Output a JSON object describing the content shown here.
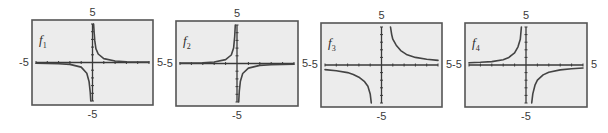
{
  "figure": {
    "background": "#ffffff",
    "frame_fill": "#ececec",
    "frame_stroke": "#555555",
    "axis_color": "#3a3a3a",
    "curve_color": "#444444"
  },
  "chart_data": [
    {
      "type": "line",
      "title": "f1",
      "name_base": "f",
      "name_sub": "1",
      "xlim": [
        -5,
        5
      ],
      "ylim": [
        -5,
        5
      ],
      "tick_labels": {
        "left": "-5",
        "right": "5",
        "top": "5",
        "bottom": "-5"
      },
      "ticks_each_axis": 10,
      "grid": false,
      "vertical_asymptote": 0,
      "horizontal_asymptote": 0,
      "description": "Hyperbola-like, branches in quadrants I and III, hugging axes closely",
      "series": [
        {
          "name": "left_branch",
          "x": [
            -5,
            -3,
            -2,
            -1,
            -0.5,
            -0.3,
            -0.2,
            -0.15
          ],
          "y": [
            -0.1,
            -0.15,
            -0.25,
            -0.6,
            -1.4,
            -2.5,
            -3.8,
            -5
          ]
        },
        {
          "name": "right_branch",
          "x": [
            0.1,
            0.15,
            0.2,
            0.3,
            0.5,
            1,
            2,
            3,
            5
          ],
          "y": [
            5,
            3.8,
            2.8,
            1.8,
            1.1,
            0.5,
            0.2,
            0.1,
            0.05
          ]
        }
      ],
      "frame": {
        "x": 32,
        "y": 20,
        "w": 121,
        "h": 85
      }
    },
    {
      "type": "line",
      "title": "f2",
      "name_base": "f",
      "name_sub": "2",
      "xlim": [
        -5,
        5
      ],
      "ylim": [
        -5,
        5
      ],
      "tick_labels": {
        "left": "-5",
        "right": "5",
        "top": "5",
        "bottom": "-5"
      },
      "ticks_each_axis": 10,
      "grid": false,
      "vertical_asymptote": 0,
      "horizontal_asymptote": 0,
      "description": "Hyperbola-like, branches in quadrants II and IV, hugging axes closely",
      "series": [
        {
          "name": "left_branch",
          "x": [
            -5,
            -3,
            -2,
            -1,
            -0.5,
            -0.3,
            -0.2,
            -0.15
          ],
          "y": [
            0.05,
            0.1,
            0.2,
            0.5,
            1.1,
            2.0,
            3.5,
            5
          ]
        },
        {
          "name": "right_branch",
          "x": [
            0.15,
            0.2,
            0.3,
            0.5,
            1,
            2,
            3,
            5
          ],
          "y": [
            -5,
            -3.6,
            -2.3,
            -1.3,
            -0.6,
            -0.25,
            -0.15,
            -0.08
          ]
        }
      ],
      "frame": {
        "x": 176,
        "y": 21,
        "w": 122,
        "h": 85
      }
    },
    {
      "type": "line",
      "title": "f3",
      "name_base": "f",
      "name_sub": "3",
      "xlim": [
        -5,
        5
      ],
      "ylim": [
        -5,
        5
      ],
      "tick_labels": {
        "left": "-5",
        "right": "5",
        "top": "5",
        "bottom": "-5"
      },
      "ticks_each_axis": 10,
      "grid": false,
      "vertical_asymptote": 0,
      "horizontal_asymptote": 0,
      "description": "Hyperbola with wider spread, branches in quadrants I and III",
      "series": [
        {
          "name": "left_branch",
          "x": [
            -5,
            -4,
            -3,
            -2.5,
            -2,
            -1.5,
            -1.2,
            -1.0,
            -0.9
          ],
          "y": [
            -0.6,
            -0.75,
            -1.0,
            -1.25,
            -1.6,
            -2.2,
            -2.8,
            -3.8,
            -5
          ]
        },
        {
          "name": "right_branch",
          "x": [
            0.8,
            0.9,
            1.0,
            1.3,
            1.7,
            2.2,
            3,
            4,
            5
          ],
          "y": [
            5,
            4.0,
            3.4,
            2.6,
            1.9,
            1.4,
            1.0,
            0.75,
            0.6
          ]
        }
      ],
      "frame": {
        "x": 321,
        "y": 23,
        "w": 121,
        "h": 84
      }
    },
    {
      "type": "line",
      "title": "f4",
      "name_base": "f",
      "name_sub": "4",
      "xlim": [
        -5,
        5
      ],
      "ylim": [
        -5,
        5
      ],
      "tick_labels": {
        "left": "-5",
        "right": "5",
        "top": "5",
        "bottom": "-5"
      },
      "ticks_each_axis": 10,
      "grid": false,
      "vertical_asymptote": 0,
      "horizontal_asymptote": 0,
      "description": "Hyperbola with moderate spread, branches in quadrants II and IV",
      "series": [
        {
          "name": "left_branch",
          "x": [
            -5,
            -4,
            -3,
            -2,
            -1.5,
            -1,
            -0.7,
            -0.5,
            -0.4
          ],
          "y": [
            0.3,
            0.35,
            0.45,
            0.7,
            1.0,
            1.6,
            2.4,
            3.4,
            5
          ]
        },
        {
          "name": "right_branch",
          "x": [
            0.5,
            0.6,
            0.8,
            1.0,
            1.5,
            2,
            3,
            4,
            5
          ],
          "y": [
            -5,
            -3.8,
            -2.6,
            -2.0,
            -1.3,
            -0.95,
            -0.65,
            -0.5,
            -0.4
          ]
        }
      ],
      "frame": {
        "x": 465,
        "y": 23,
        "w": 122,
        "h": 84
      }
    }
  ]
}
